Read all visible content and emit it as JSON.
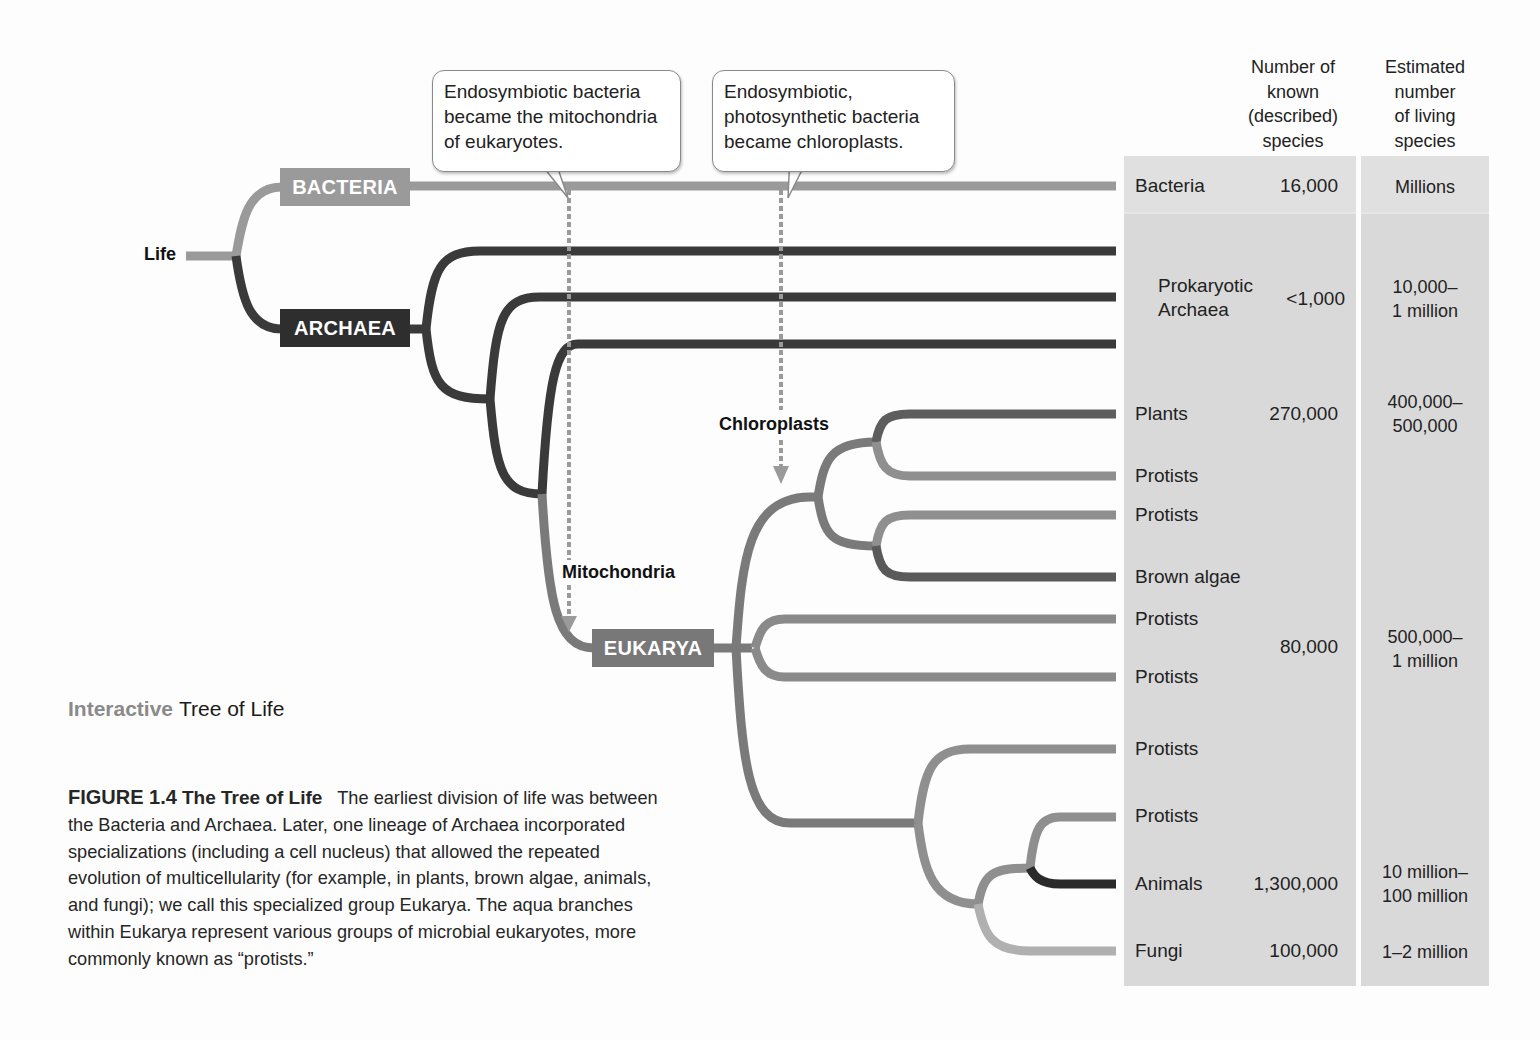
{
  "figure": {
    "root_label": "Life",
    "clades": {
      "bacteria": "BACTERIA",
      "archaea": "ARCHAEA",
      "eukarya": "EUKARYA"
    },
    "colors": {
      "bacteria": "#9a9a9a",
      "archaea": "#3a3a3a",
      "eukarya": "#787878",
      "protist": "#8f8f8f",
      "plant": "#5e5e5e",
      "brown_algae": "#5a5a5a",
      "animal": "#2a2a2a",
      "fungi": "#b0b0b0",
      "table_bg": "#d9d9d9"
    },
    "callouts": {
      "mitochondria": [
        "Endosymbiotic bacteria",
        "became the mitochondria",
        "of eukaryotes."
      ],
      "chloroplasts": [
        "Endosymbiotic,",
        "photosynthetic bacteria",
        "became chloroplasts."
      ]
    },
    "event_labels": {
      "mitochondria": "Mitochondria",
      "chloroplasts": "Chloroplasts"
    }
  },
  "table": {
    "headers": {
      "known": [
        "Number of",
        "known",
        "(described)",
        "species"
      ],
      "estimated": [
        "Estimated",
        "number",
        "of living",
        "species"
      ]
    },
    "leaves": [
      {
        "name": "Bacteria"
      },
      {
        "name": "Prokaryotic"
      },
      {
        "name": "Archaea"
      },
      {
        "name": "Plants"
      },
      {
        "name": "Protists"
      },
      {
        "name": "Protists"
      },
      {
        "name": "Brown algae"
      },
      {
        "name": "Protists"
      },
      {
        "name": "Protists"
      },
      {
        "name": "Protists"
      },
      {
        "name": "Protists"
      },
      {
        "name": "Animals"
      },
      {
        "name": "Fungi"
      }
    ],
    "known_counts": {
      "bacteria": "16,000",
      "archaea": "<1,000",
      "plants": "270,000",
      "protists": "80,000",
      "animals": "1,300,000",
      "fungi": "100,000"
    },
    "estimated_counts": {
      "bacteria": [
        "Millions"
      ],
      "archaea": [
        "10,000–",
        "1 million"
      ],
      "plants": [
        "400,000–",
        "500,000"
      ],
      "protists": [
        "500,000–",
        "1 million"
      ],
      "animals": [
        "10 million–",
        "100 million"
      ],
      "fungi": [
        "1–2 million"
      ]
    }
  },
  "caption": {
    "interactive_prefix": "Interactive",
    "interactive_title": "Tree of Life",
    "figure_number": "FIGURE 1.4",
    "figure_title": "The Tree of Life",
    "body": "The earliest division of life was between the Bacteria and Archaea. Later, one lineage of Archaea incorporated specializations (including a cell nucleus) that allowed the repeated evolution of multicellularity (for example, in plants, brown algae, animals, and fungi); we call this specialized group Eukarya. The aqua branches within Eukarya represent various groups of microbial eukaryotes, more commonly known as “protists.”"
  }
}
